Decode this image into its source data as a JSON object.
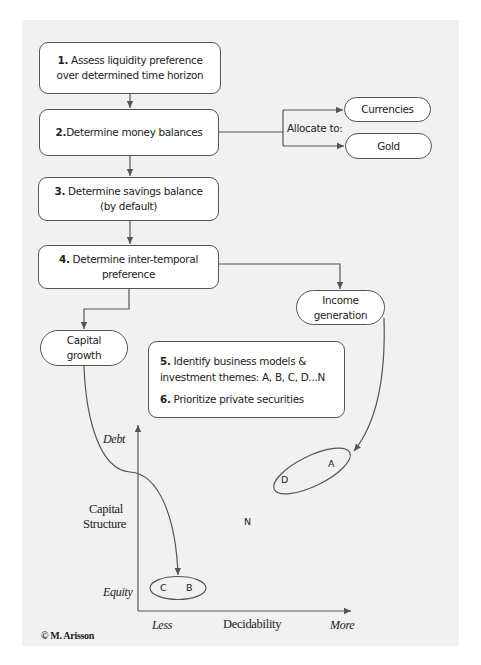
{
  "flowchart": {
    "step1": {
      "num": "1.",
      "line1": "Assess liquidity preference",
      "line2": "over determined time horizon"
    },
    "step2": {
      "num": "2.",
      "text": "Determine money balances"
    },
    "allocate_label": "Allocate to:",
    "currencies": "Currencies",
    "gold": "Gold",
    "step3": {
      "num": "3.",
      "line1": "Determine savings balance",
      "line2": "(by default)"
    },
    "step4": {
      "num": "4.",
      "line1": "Determine inter-temporal",
      "line2": "preference"
    },
    "income": {
      "line1": "Income",
      "line2": "generation"
    },
    "capital": {
      "line1": "Capital",
      "line2": "growth"
    },
    "step5": {
      "num": "5.",
      "line1": "Identify business models &",
      "line2": "investment themes: A, B, C, D...N"
    },
    "step6": {
      "num": "6.",
      "text": "Prioritize private securities"
    }
  },
  "chart": {
    "y_axis_label_line1": "Capital",
    "y_axis_label_line2": "Structure",
    "y_top": "Debt",
    "y_bottom": "Equity",
    "x_axis_label": "Decidability",
    "x_left": "Less",
    "x_right": "More",
    "points": {
      "A": "A",
      "B": "B",
      "C": "C",
      "D": "D",
      "N": "N"
    }
  },
  "copyright": "© M. Arisson",
  "colors": {
    "panel": "#f1f1f1",
    "stroke": "#555555",
    "box_fill": "#ffffff"
  }
}
